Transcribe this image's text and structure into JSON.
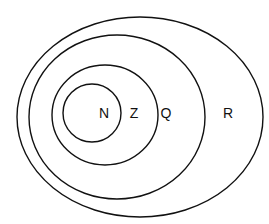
{
  "diagram": {
    "type": "nested-venn",
    "stroke_color": "#111111",
    "background": "#ffffff",
    "sets": [
      {
        "label": "N",
        "contained_in": "Z"
      },
      {
        "label": "Z",
        "contained_in": "Q"
      },
      {
        "label": "Q",
        "contained_in": "R"
      },
      {
        "label": "R",
        "contained_in": null
      }
    ]
  },
  "labels": {
    "n": "N",
    "z": "Z",
    "q": "Q",
    "r": "R"
  }
}
